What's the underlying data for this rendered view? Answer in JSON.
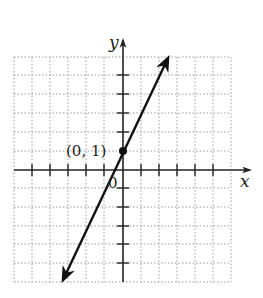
{
  "diagram": {
    "type": "coordinate-plane-line-graph",
    "axes": {
      "x_label": "x",
      "y_label": "y",
      "origin_label": "0"
    },
    "point": {
      "label": "(0, 1)",
      "x": 0,
      "y": 1
    },
    "line": {
      "slope": 2,
      "y_intercept": 1,
      "equation_implied": "y = 2x + 1",
      "arrows": "both-ends"
    },
    "grid": {
      "x_range": [
        -6,
        6
      ],
      "y_range": [
        -6,
        6
      ],
      "style": "dotted"
    },
    "colors": {
      "line": "#111111",
      "grid": "#9a9a9a",
      "axis": "#222222"
    }
  }
}
